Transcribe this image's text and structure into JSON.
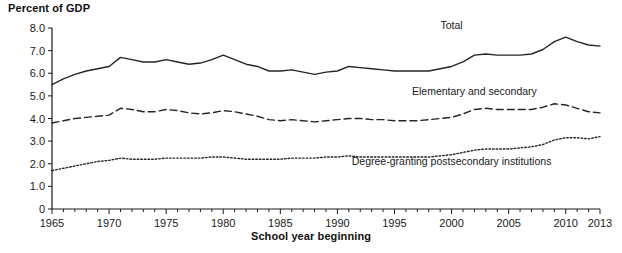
{
  "chart_data": {
    "type": "line",
    "title": "",
    "ylabel": "Percent of GDP",
    "xlabel": "School year beginning",
    "ylim": [
      0,
      8.0
    ],
    "xlim": [
      1965,
      2013
    ],
    "grid": false,
    "legend_position": "inline-annotations",
    "ytick_labels": [
      "8.0",
      "7.0",
      "6.0",
      "5.0",
      "4.0",
      "3.0",
      "2.0",
      "1.0",
      "0"
    ],
    "ytick_values": [
      8.0,
      7.0,
      6.0,
      5.0,
      4.0,
      3.0,
      2.0,
      1.0,
      0
    ],
    "xtick_labels": [
      "1965",
      "1970",
      "1975",
      "1980",
      "1985",
      "1990",
      "1995",
      "2000",
      "2005",
      "2010",
      "2013"
    ],
    "xtick_values": [
      1965,
      1970,
      1975,
      1980,
      1985,
      1990,
      1995,
      2000,
      2005,
      2010,
      2013
    ],
    "x": [
      1965,
      1966,
      1967,
      1968,
      1969,
      1970,
      1971,
      1972,
      1973,
      1974,
      1975,
      1976,
      1977,
      1978,
      1979,
      1980,
      1981,
      1982,
      1983,
      1984,
      1985,
      1986,
      1987,
      1988,
      1989,
      1990,
      1991,
      1992,
      1993,
      1994,
      1995,
      1996,
      1997,
      1998,
      1999,
      2000,
      2001,
      2002,
      2003,
      2004,
      2005,
      2006,
      2007,
      2008,
      2009,
      2010,
      2011,
      2012,
      2013
    ],
    "series": [
      {
        "name": "Total",
        "style": "solid",
        "label_x": 2000,
        "label_y": 7.95,
        "values": [
          5.5,
          5.75,
          5.95,
          6.1,
          6.2,
          6.3,
          6.7,
          6.6,
          6.5,
          6.5,
          6.6,
          6.5,
          6.4,
          6.45,
          6.6,
          6.8,
          6.6,
          6.4,
          6.3,
          6.1,
          6.1,
          6.15,
          6.05,
          5.95,
          6.05,
          6.1,
          6.3,
          6.25,
          6.2,
          6.15,
          6.1,
          6.1,
          6.1,
          6.1,
          6.2,
          6.3,
          6.5,
          6.8,
          6.85,
          6.8,
          6.8,
          6.8,
          6.85,
          7.05,
          7.4,
          7.6,
          7.4,
          7.25,
          7.2
        ]
      },
      {
        "name": "Elementary and secondary",
        "style": "dashed",
        "label_x": 2002,
        "label_y": 5.05,
        "values": [
          3.8,
          3.9,
          4.0,
          4.05,
          4.1,
          4.15,
          4.45,
          4.4,
          4.3,
          4.3,
          4.4,
          4.35,
          4.25,
          4.2,
          4.25,
          4.35,
          4.3,
          4.2,
          4.1,
          3.95,
          3.9,
          3.95,
          3.9,
          3.85,
          3.9,
          3.95,
          4.0,
          4.0,
          3.95,
          3.95,
          3.9,
          3.9,
          3.9,
          3.95,
          4.0,
          4.05,
          4.2,
          4.4,
          4.45,
          4.4,
          4.4,
          4.4,
          4.4,
          4.5,
          4.65,
          4.6,
          4.45,
          4.3,
          4.25
        ]
      },
      {
        "name": "Degree-granting postsecondary institutions",
        "style": "dotted",
        "label_x": 2000,
        "label_y": 1.95,
        "values": [
          1.7,
          1.8,
          1.9,
          2.0,
          2.1,
          2.15,
          2.25,
          2.2,
          2.2,
          2.2,
          2.25,
          2.25,
          2.25,
          2.25,
          2.3,
          2.3,
          2.25,
          2.2,
          2.2,
          2.2,
          2.2,
          2.25,
          2.25,
          2.25,
          2.3,
          2.3,
          2.35,
          2.3,
          2.3,
          2.3,
          2.3,
          2.3,
          2.3,
          2.3,
          2.35,
          2.4,
          2.5,
          2.6,
          2.65,
          2.65,
          2.65,
          2.7,
          2.75,
          2.85,
          3.05,
          3.15,
          3.15,
          3.1,
          3.2
        ]
      }
    ]
  },
  "plot_geometry": {
    "left": 52,
    "right": 600,
    "top": 28,
    "bottom": 209
  }
}
